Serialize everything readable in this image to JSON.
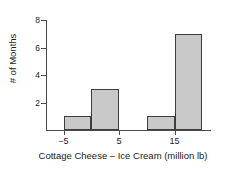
{
  "chart_data": {
    "type": "bar",
    "title": "",
    "subtitle": "",
    "xlabel": "Cottage Cheese – Ice Cream (million lb)",
    "ylabel": "# of Months",
    "grid": false,
    "legend": "none",
    "xlim": [
      -10,
      25
    ],
    "ylim": [
      0,
      8
    ],
    "bin_width": 5,
    "x_ticks": [
      {
        "value": -5,
        "label": "−5"
      },
      {
        "value": 5,
        "label": "5"
      },
      {
        "value": 15,
        "label": "15"
      }
    ],
    "y_ticks": [
      {
        "value": 2,
        "label": "2"
      },
      {
        "value": 4,
        "label": "4"
      },
      {
        "value": 6,
        "label": "6"
      },
      {
        "value": 8,
        "label": "8"
      }
    ],
    "bars": [
      {
        "bin_start": -5,
        "bin_end": 0,
        "value": 1
      },
      {
        "bin_start": 0,
        "bin_end": 5,
        "value": 3
      },
      {
        "bin_start": 10,
        "bin_end": 15,
        "value": 1
      },
      {
        "bin_start": 15,
        "bin_end": 20,
        "value": 7
      }
    ],
    "categories": [
      "-5 to 0",
      "0 to 5",
      "10 to 15",
      "15 to 20"
    ],
    "values": [
      1,
      3,
      1,
      7
    ],
    "colors": {
      "bar_fill": "#c9c9c9",
      "bar_border": "#3d3d3d",
      "axis": "#4a4a4a",
      "text": "#1a1a1a",
      "background": "#ffffff"
    }
  }
}
